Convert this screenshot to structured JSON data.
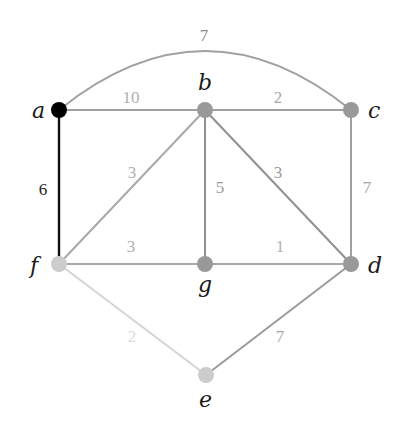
{
  "diagram": {
    "type": "weighted-undirected-graph",
    "nodes": [
      {
        "id": "a",
        "label": "a",
        "x": 59,
        "y": 110,
        "color": "#000000",
        "label_x": 32,
        "label_y": 118
      },
      {
        "id": "b",
        "label": "b",
        "x": 205,
        "y": 110,
        "color": "#999999",
        "label_x": 198,
        "label_y": 90
      },
      {
        "id": "c",
        "label": "c",
        "x": 351,
        "y": 110,
        "color": "#999999",
        "label_x": 368,
        "label_y": 118
      },
      {
        "id": "d",
        "label": "d",
        "x": 351,
        "y": 264,
        "color": "#999999",
        "label_x": 368,
        "label_y": 273
      },
      {
        "id": "e",
        "label": "e",
        "x": 206,
        "y": 375,
        "color": "#cccccc",
        "label_x": 199,
        "label_y": 407
      },
      {
        "id": "f",
        "label": "f",
        "x": 59,
        "y": 264,
        "color": "#cccccc",
        "label_x": 30,
        "label_y": 273
      },
      {
        "id": "g",
        "label": "g",
        "x": 205,
        "y": 264,
        "color": "#999999",
        "label_x": 198,
        "label_y": 292
      }
    ],
    "edges": [
      {
        "from": "a",
        "to": "c",
        "weight": "7",
        "shape": "arc",
        "color": "#a0a0a0",
        "label_color": "#8a8a8a",
        "label_x": 204,
        "label_y": 41
      },
      {
        "from": "a",
        "to": "b",
        "weight": "10",
        "color": "#a0a0a0",
        "label_color": "#b0b0b0",
        "label_x": 131,
        "label_y": 103
      },
      {
        "from": "b",
        "to": "c",
        "weight": "2",
        "color": "#a0a0a0",
        "label_color": "#a8a8a8",
        "label_x": 278,
        "label_y": 103
      },
      {
        "from": "a",
        "to": "f",
        "weight": "6",
        "color": "#111111",
        "label_color": "#222222",
        "label_x": 43,
        "label_y": 195
      },
      {
        "from": "b",
        "to": "f",
        "weight": "3",
        "color": "#a8a8a8",
        "label_color": "#b0b0b0",
        "label_x": 132,
        "label_y": 178
      },
      {
        "from": "b",
        "to": "g",
        "weight": "5",
        "color": "#909090",
        "label_color": "#9a9a9a",
        "label_x": 220,
        "label_y": 193
      },
      {
        "from": "b",
        "to": "d",
        "weight": "3",
        "color": "#909090",
        "label_color": "#9a9a9a",
        "label_x": 278,
        "label_y": 178
      },
      {
        "from": "c",
        "to": "d",
        "weight": "7",
        "color": "#a0a0a0",
        "label_color": "#a8a8a8",
        "label_x": 367,
        "label_y": 193
      },
      {
        "from": "f",
        "to": "g",
        "weight": "3",
        "color": "#a8a8a8",
        "label_color": "#b0b0b0",
        "label_x": 131,
        "label_y": 252
      },
      {
        "from": "g",
        "to": "d",
        "weight": "1",
        "color": "#a8a8a8",
        "label_color": "#b0b0b0",
        "label_x": 280,
        "label_y": 252
      },
      {
        "from": "f",
        "to": "e",
        "weight": "2",
        "color": "#d4d4d4",
        "label_color": "#dddddd",
        "label_x": 132,
        "label_y": 342
      },
      {
        "from": "e",
        "to": "d",
        "weight": "7",
        "color": "#9a9a9a",
        "label_color": "#a8a8a8",
        "label_x": 280,
        "label_y": 342
      }
    ]
  }
}
